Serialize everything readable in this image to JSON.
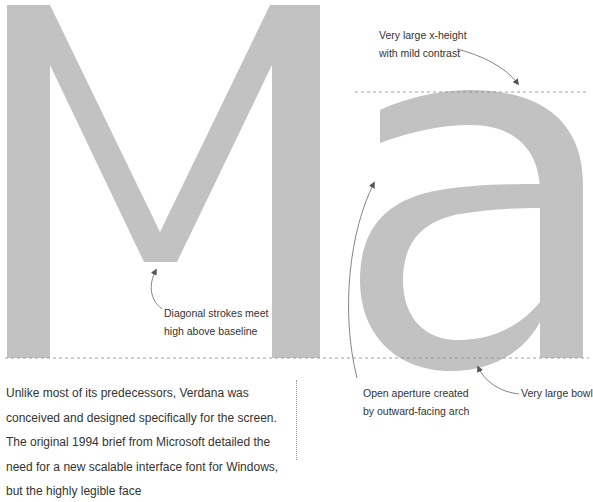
{
  "specimen": {
    "letters": [
      "M",
      "a"
    ],
    "glyph_color": "#c2c2c2",
    "guide_color": "#8a8a8a"
  },
  "annotations": {
    "x_height": {
      "line1": "Very large x-height",
      "line2": "with mild contrast"
    },
    "vertex": {
      "line1": "Diagonal strokes meet",
      "line2": "high above baseline"
    },
    "aperture": {
      "line1": "Open aperture created",
      "line2": "by outward-facing arch"
    },
    "bowl": {
      "line1": "Very large bowl"
    }
  },
  "body": {
    "paragraph": "Unlike most of its predecessors, Verdana was conceived and designed specifically for the screen. The original 1994 brief from Microsoft detailed the need for a new scalable interface font for Windows, but the highly legible face"
  }
}
